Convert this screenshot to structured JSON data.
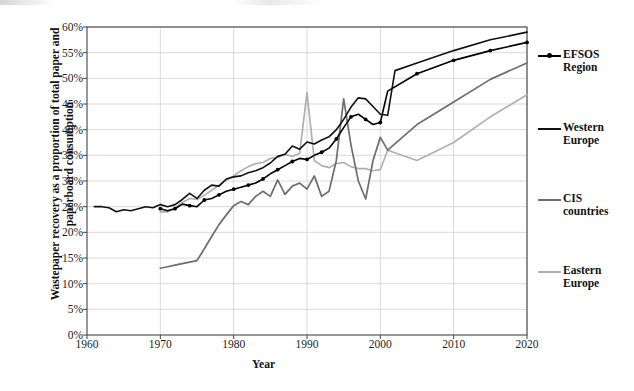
{
  "chart_data": {
    "type": "line",
    "title": "",
    "xlabel": "Year",
    "ylabel": "Wastepaper recovery as a proportion of total paper and paperboard consumption",
    "xlim": [
      1960,
      2020
    ],
    "ylim": [
      0,
      60
    ],
    "grid": true,
    "legend_position": "right",
    "x_ticks": [
      1960,
      1970,
      1980,
      1990,
      2000,
      2010,
      2020
    ],
    "x_tick_labels": [
      "1960",
      "1970",
      "1980",
      "1990",
      "2000",
      "2010",
      "2020"
    ],
    "y_ticks": [
      0,
      5,
      10,
      15,
      20,
      25,
      30,
      35,
      40,
      45,
      50,
      55,
      60
    ],
    "y_tick_labels": [
      "0%",
      "5%",
      "10%",
      "15%",
      "20%",
      "25%",
      "30%",
      "35%",
      "40%",
      "45%",
      "50%",
      "55%",
      "60%"
    ],
    "series": [
      {
        "name": "EFSOS Region",
        "color": "#000000",
        "width": 1.6,
        "markers": true,
        "x": [
          1970,
          1971,
          1972,
          1973,
          1974,
          1975,
          1976,
          1977,
          1978,
          1979,
          1980,
          1981,
          1982,
          1983,
          1984,
          1985,
          1986,
          1987,
          1988,
          1989,
          1990,
          1991,
          1992,
          1993,
          1994,
          1995,
          1996,
          1997,
          1998,
          1999,
          2000,
          2001,
          2005,
          2010,
          2015,
          2020
        ],
        "y": [
          24.6,
          24.2,
          24.6,
          25.5,
          25.2,
          25.0,
          26.3,
          26.6,
          27.3,
          28.0,
          28.4,
          28.8,
          29.2,
          29.6,
          30.4,
          31.4,
          32.2,
          33.0,
          33.8,
          34.4,
          34.2,
          35.0,
          35.6,
          36.4,
          38.2,
          40.4,
          42.5,
          43.0,
          42.0,
          41.0,
          41.4,
          47.5,
          50.9,
          53.5,
          55.4,
          57.0
        ]
      },
      {
        "name": "Western Europe",
        "color": "#111111",
        "width": 1.6,
        "markers": false,
        "x": [
          1961,
          1962,
          1963,
          1964,
          1965,
          1966,
          1967,
          1968,
          1969,
          1970,
          1971,
          1972,
          1973,
          1974,
          1975,
          1976,
          1977,
          1978,
          1979,
          1980,
          1981,
          1982,
          1983,
          1984,
          1985,
          1986,
          1987,
          1988,
          1989,
          1990,
          1991,
          1992,
          1993,
          1994,
          1995,
          1996,
          1997,
          1998,
          1999,
          2000,
          2001,
          2002,
          2005,
          2010,
          2015,
          2020
        ],
        "y": [
          25.0,
          25.0,
          24.8,
          24.0,
          24.4,
          24.2,
          24.6,
          25.0,
          24.8,
          25.4,
          25.0,
          25.4,
          26.4,
          27.6,
          26.6,
          28.2,
          29.2,
          29.0,
          30.4,
          30.8,
          31.0,
          31.6,
          32.0,
          32.6,
          33.5,
          34.8,
          35.2,
          36.8,
          36.2,
          37.6,
          37.2,
          38.0,
          38.6,
          40.0,
          42.0,
          44.4,
          46.2,
          46.0,
          44.5,
          43.0,
          42.8,
          51.5,
          53.0,
          55.4,
          57.5,
          59.0
        ]
      },
      {
        "name": "CIS countries",
        "color": "#6e6e6e",
        "width": 1.7,
        "markers": false,
        "x": [
          1970,
          1971,
          1972,
          1973,
          1974,
          1975,
          1976,
          1977,
          1978,
          1979,
          1980,
          1981,
          1982,
          1983,
          1984,
          1985,
          1986,
          1987,
          1988,
          1989,
          1990,
          1991,
          1992,
          1993,
          1994,
          1995,
          1996,
          1997,
          1998,
          1999,
          2000,
          2001,
          2005,
          2010,
          2015,
          2020
        ],
        "y": [
          13.0,
          13.3,
          13.6,
          13.9,
          14.2,
          14.5,
          16.8,
          19.2,
          21.5,
          23.4,
          25.2,
          26.0,
          25.4,
          27.0,
          28.0,
          27.0,
          30.2,
          27.4,
          29.0,
          29.6,
          28.4,
          31.0,
          27.0,
          28.0,
          34.0,
          46.0,
          37.0,
          30.0,
          26.5,
          34.0,
          38.5,
          36.0,
          41.0,
          45.4,
          49.8,
          53.0
        ]
      },
      {
        "name": "Eastern Europe",
        "color": "#b0b0b0",
        "width": 1.7,
        "markers": false,
        "x": [
          1970,
          1971,
          1972,
          1973,
          1974,
          1975,
          1976,
          1977,
          1978,
          1979,
          1980,
          1981,
          1982,
          1983,
          1984,
          1985,
          1986,
          1987,
          1988,
          1989,
          1990,
          1991,
          1992,
          1993,
          1994,
          1995,
          1996,
          1997,
          1998,
          1999,
          2000,
          2001,
          2005,
          2010,
          2015,
          2020
        ],
        "y": [
          24.0,
          24.0,
          24.8,
          25.8,
          26.6,
          26.4,
          27.2,
          28.2,
          29.2,
          30.2,
          31.0,
          32.0,
          32.8,
          33.4,
          33.6,
          34.4,
          34.6,
          35.2,
          34.8,
          35.4,
          47.2,
          34.0,
          33.0,
          32.6,
          33.4,
          33.6,
          32.8,
          32.4,
          32.4,
          32.0,
          32.2,
          36.0,
          34.0,
          37.5,
          42.5,
          46.8
        ]
      }
    ]
  },
  "legend": {
    "entries": [
      {
        "label_line1": "EFSOS",
        "label_line2": "Region"
      },
      {
        "label_line1": "Western",
        "label_line2": "Europe"
      },
      {
        "label_line1": "CIS",
        "label_line2": "countries"
      },
      {
        "label_line1": "Eastern",
        "label_line2": "Europe"
      }
    ]
  },
  "axes": {
    "plot_border_color": "#444444",
    "gridline_color": "#d0d0d0"
  }
}
